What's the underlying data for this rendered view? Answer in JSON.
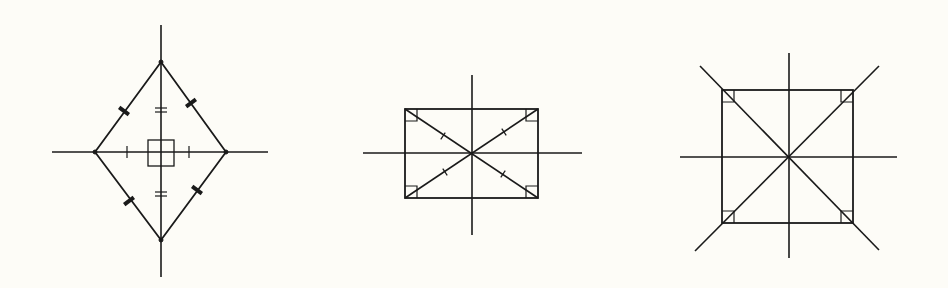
{
  "diagram": {
    "title": "",
    "background": "#fdfcf7",
    "stroke_color": "#1a1a1a",
    "figures": [
      {
        "id": "rhombus",
        "label": "",
        "axes": {
          "vertical": {
            "x": 161,
            "y1": 25,
            "y2": 277
          },
          "horizontal": {
            "y": 152,
            "x1": 52,
            "x2": 268
          }
        },
        "vertices": [
          [
            161,
            62
          ],
          [
            226,
            152
          ],
          [
            161,
            240
          ],
          [
            95,
            152
          ]
        ],
        "right_angle_box": {
          "x": 148,
          "y": 140,
          "w": 26,
          "h": 26
        },
        "side_ticks": [
          [
            124,
            111
          ],
          [
            191,
            103
          ],
          [
            129,
            201
          ],
          [
            197,
            190
          ]
        ],
        "double_ticks_y": [
          110,
          194
        ],
        "single_ticks_x": [
          127,
          189
        ]
      },
      {
        "id": "rectangle",
        "label": "",
        "axes": {
          "vertical": {
            "x": 472,
            "y1": 75,
            "y2": 235
          },
          "horizontal": {
            "y": 153,
            "x1": 363,
            "x2": 582
          }
        },
        "rect": {
          "x1": 405,
          "y1": 109,
          "x2": 538,
          "y2": 198
        },
        "corner_box_size": 12,
        "diagonal_ticks": [
          [
            443,
            136
          ],
          [
            504,
            132
          ],
          [
            445,
            172
          ],
          [
            503,
            174
          ]
        ]
      },
      {
        "id": "square",
        "label": "",
        "axes": {
          "vertical": {
            "x": 789,
            "y1": 53,
            "y2": 258
          },
          "horizontal": {
            "y": 157,
            "x1": 680,
            "x2": 897
          }
        },
        "rect": {
          "x1": 722,
          "y1": 90,
          "x2": 853,
          "y2": 223
        },
        "corner_box_size": 12,
        "diagonals_extended": [
          [
            700,
            66,
            879,
            250
          ],
          [
            879,
            66,
            695,
            251
          ]
        ]
      }
    ]
  }
}
